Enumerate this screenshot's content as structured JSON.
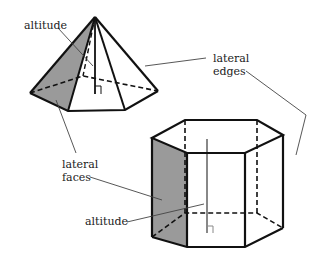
{
  "labels": {
    "pyramid_altitude": "altitude",
    "lateral_edges_line1": "lateral",
    "lateral_edges_line2": "edges",
    "lateral_faces_line1": "lateral",
    "lateral_faces_line2": "faces",
    "prism_altitude": "altitude"
  },
  "colors": {
    "stroke": "#111111",
    "shade": "#9a9a9a",
    "altitude_gray": "#888888",
    "leader": "#444444"
  },
  "figures": [
    "hexagonal pyramid",
    "hexagonal prism"
  ]
}
